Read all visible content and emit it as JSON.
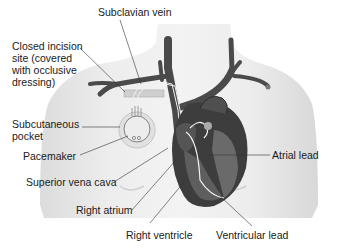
{
  "figure": {
    "labels": {
      "subclavian_vein": "Subclavian vein",
      "closed_incision": "Closed incision site (covered with occlusive dressing)",
      "subcutaneous_pocket": "Subcutaneous pocket",
      "pacemaker": "Pacemaker",
      "superior_vena_cava": "Superior vena cava",
      "right_atrium": "Right atrium",
      "right_ventricle": "Right ventricle",
      "atrial_lead": "Atrial lead",
      "ventricular_lead": "Ventricular lead"
    },
    "colors": {
      "skin": "#e9e9e9",
      "vein": "#4a4a4a",
      "heart": "#3d3d3d",
      "chamber": "#6a6a6a",
      "lead": "#f4f4f4",
      "leader_line": "#333333"
    }
  }
}
